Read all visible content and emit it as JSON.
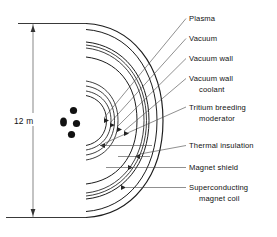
{
  "figure": {
    "dimension": {
      "label": "12 m",
      "name": "overall-height"
    },
    "plasma_dots": [
      {
        "cx": 63.5,
        "cy": 122.0,
        "rx": 3.4,
        "ry": 4.6
      },
      {
        "cx": 73.5,
        "cy": 110.5,
        "rx": 3.6,
        "ry": 3.6
      },
      {
        "cx": 76.5,
        "cy": 123.5,
        "rx": 3.6,
        "ry": 3.6
      },
      {
        "cx": 71.5,
        "cy": 134.5,
        "rx": 3.6,
        "ry": 3.6
      }
    ],
    "callouts": [
      {
        "id": "plasma",
        "lines": [
          "Plasma"
        ],
        "text_x": 189,
        "text_y": 21,
        "leader": "M 186 18.5 L 104 118",
        "stroke": 0.55
      },
      {
        "id": "vacuum",
        "lines": [
          "Vacuum"
        ],
        "text_x": 189,
        "text_y": 41,
        "leader": "M 186 38.5 L 110 123",
        "stroke": 0.55
      },
      {
        "id": "vacuum-wall",
        "lines": [
          "Vacuum wall"
        ],
        "text_x": 189,
        "text_y": 61,
        "leader": "M 186 58.5 L 117 127",
        "stroke": 0.55
      },
      {
        "id": "vacuum-wall-coolant",
        "lines": [
          "Vacuum wall",
          "coolant"
        ],
        "text_x": 189,
        "text_y": 81,
        "leader": "M 186 78.5 L 124 131",
        "stroke": 0.55
      },
      {
        "id": "tritium-breeding-moderator",
        "lines": [
          "Tritium breeding",
          "moderator"
        ],
        "text_x": 189,
        "text_y": 110,
        "leader": "M 186 107 L 105 143",
        "stroke": 0.55
      },
      {
        "id": "thermal-insulation",
        "lines": [
          "Thermal insulation"
        ],
        "text_x": 189,
        "text_y": 148,
        "leader": "M 186 145.5 L 140 154",
        "stroke": 0.6
      },
      {
        "id": "magnet-shield",
        "lines": [
          "Magnet shield"
        ],
        "text_x": 189,
        "text_y": 170,
        "leader": "M 186 167.5 L 133 167.5",
        "stroke": 0.6
      },
      {
        "id": "superconducting-magnet-coil",
        "lines": [
          "Superconducting",
          "magnet coil"
        ],
        "text_x": 189,
        "text_y": 190,
        "leader": "M 186 187.5 L 126 187.5",
        "stroke": 0.6
      }
    ],
    "colors": {
      "line": "#1c1c1c",
      "leader": "#444444",
      "text": "#111111",
      "background": "#ffffff"
    }
  }
}
